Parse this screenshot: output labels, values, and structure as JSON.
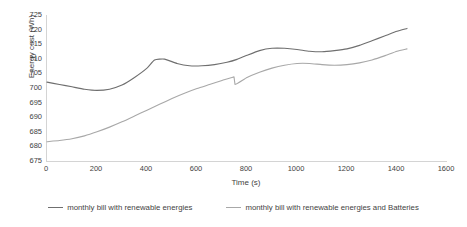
{
  "chart_data": {
    "type": "line",
    "title": "",
    "xlabel": "Time (s)",
    "ylabel": "Energy cost (Wh)",
    "xlim": [
      0,
      1600
    ],
    "ylim": [
      675,
      725
    ],
    "xticks": [
      0,
      200,
      400,
      600,
      800,
      1000,
      1200,
      1400,
      1600
    ],
    "yticks": [
      675,
      680,
      685,
      690,
      695,
      700,
      705,
      710,
      715,
      720,
      725
    ],
    "grid": false,
    "legend_position": "bottom",
    "series": [
      {
        "name": "monthly bill with renewable energies",
        "color": "#6f6f6f",
        "x": [
          0,
          50,
          100,
          150,
          200,
          250,
          300,
          350,
          400,
          430,
          470,
          520,
          570,
          620,
          670,
          720,
          760,
          800,
          850,
          900,
          950,
          1000,
          1050,
          1100,
          1150,
          1200,
          1250,
          1300,
          1350,
          1400,
          1440
        ],
        "y": [
          702.0,
          701.2,
          700.4,
          699.6,
          699.2,
          699.6,
          701.0,
          703.6,
          706.8,
          709.6,
          709.9,
          708.4,
          707.6,
          707.6,
          708.0,
          708.8,
          709.8,
          711.2,
          712.8,
          713.6,
          713.6,
          713.2,
          712.6,
          712.4,
          712.8,
          713.4,
          714.6,
          716.2,
          717.8,
          719.4,
          720.4
        ]
      },
      {
        "name": "monthly bill with renewable energies and Batteries",
        "color": "#a8a8a8",
        "x": [
          0,
          50,
          100,
          150,
          200,
          250,
          300,
          350,
          400,
          450,
          500,
          550,
          600,
          650,
          700,
          740,
          748,
          752,
          800,
          850,
          900,
          950,
          1000,
          1050,
          1100,
          1150,
          1200,
          1250,
          1300,
          1350,
          1400,
          1440
        ],
        "y": [
          681.6,
          682.0,
          682.6,
          683.6,
          685.0,
          686.6,
          688.4,
          690.4,
          692.4,
          694.4,
          696.4,
          698.2,
          699.8,
          701.2,
          702.6,
          703.6,
          703.8,
          701.2,
          703.6,
          705.4,
          706.8,
          707.8,
          708.4,
          708.4,
          708.0,
          707.8,
          708.0,
          708.6,
          709.6,
          711.0,
          712.6,
          713.4
        ]
      }
    ]
  }
}
